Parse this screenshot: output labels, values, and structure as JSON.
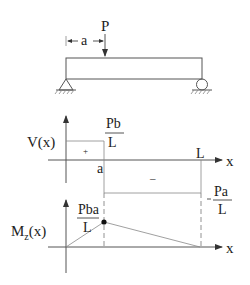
{
  "beam": {
    "load_label": "P",
    "distance_label": "a"
  },
  "shear": {
    "axis_label": "V(x)",
    "x_label": "x",
    "positive_sign": "+",
    "negative_sign": "–",
    "a_label": "a",
    "L_label": "L",
    "pos_value": {
      "num": "Pb",
      "den": "L"
    },
    "neg_value": {
      "num": "Pa",
      "den": "L"
    }
  },
  "moment": {
    "axis_label_main": "M",
    "axis_label_sub": "z",
    "axis_label_tail": "(x)",
    "x_label": "x",
    "peak_value": {
      "num": "Pba",
      "den": "L"
    }
  }
}
